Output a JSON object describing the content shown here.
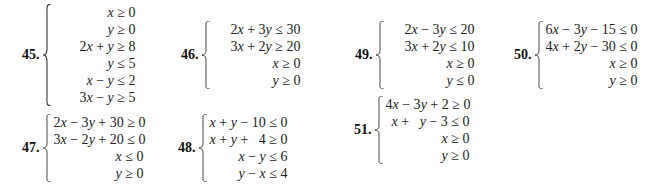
{
  "problems": [
    {
      "number": "45.",
      "inequalities": [
        "x ≥ 0",
        "y ≥ 0",
        "2x + y ≥ 8",
        "y ≤ 5",
        "x − y ≤ 2",
        "3x − y ≥ 5"
      ]
    },
    {
      "number": "46.",
      "inequalities": [
        "2x + 3y ≤ 30",
        "3x + 2y ≥ 20",
        "x ≥ 0",
        "y ≥ 0"
      ]
    },
    {
      "number": "49.",
      "inequalities": [
        "2x − 3y ≤ 20",
        "3x + 2y ≤ 10",
        "x ≥ 0",
        "y ≤ 0"
      ]
    },
    {
      "number": "50.",
      "inequalities": [
        "6x − 3y − 15 ≤ 0",
        "4x + 2y − 30 ≤ 0",
        "x ≥ 0",
        "y ≥ 0"
      ]
    },
    {
      "number": "47.",
      "inequalities": [
        "2x − 3y + 30 ≥ 0",
        "3x − 2y + 20 ≤ 0",
        "x ≤ 0",
        "y ≥ 0"
      ]
    },
    {
      "number": "48.",
      "inequalities": [
        "x + y − 10 ≤ 0",
        "x + y +   4 ≥ 0",
        "x − y ≤ 6",
        "y − x ≤ 4"
      ]
    },
    {
      "number": "51.",
      "inequalities": [
        "4x − 3y + 2 ≥ 0",
        "x +   y − 3 ≤ 0",
        "x ≥ 0",
        "y ≥ 0"
      ]
    }
  ]
}
